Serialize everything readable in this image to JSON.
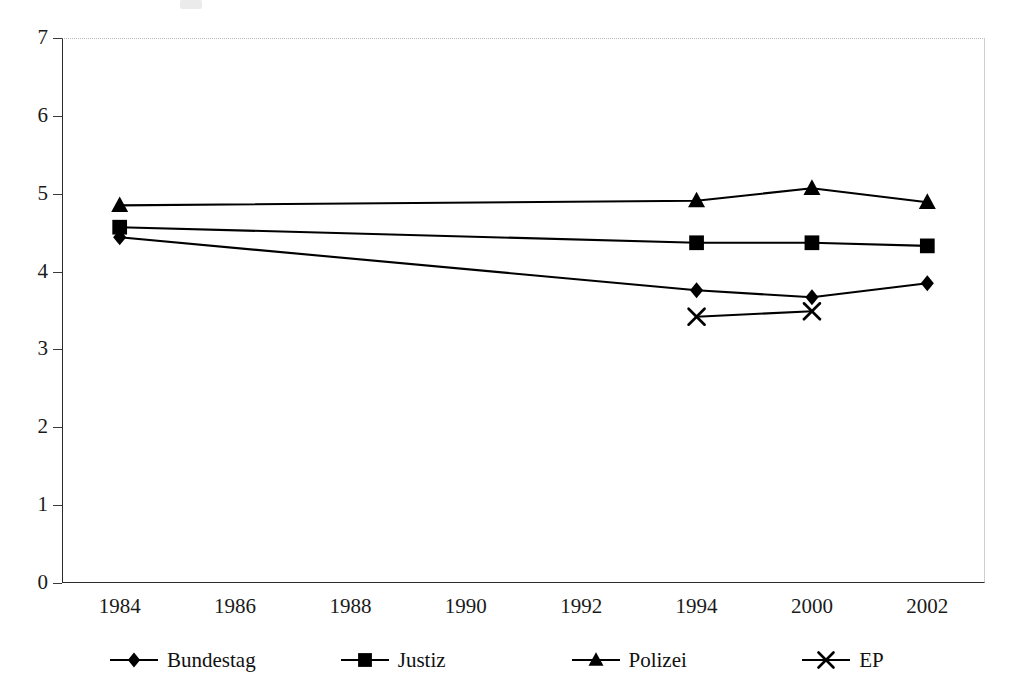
{
  "chart_data": {
    "type": "line",
    "title": "",
    "xlabel": "",
    "ylabel": "",
    "categories": [
      "1984",
      "1986",
      "1988",
      "1990",
      "1992",
      "1994",
      "2000",
      "2002"
    ],
    "ylim": [
      0,
      7
    ],
    "ytick_labels": [
      "0",
      "1",
      "2",
      "3",
      "4",
      "5",
      "6",
      "7"
    ],
    "yticks": [
      0,
      1,
      2,
      3,
      4,
      5,
      6,
      7
    ],
    "grid": false,
    "legend_position": "bottom",
    "series": [
      {
        "name": "Bundestag",
        "marker": "diamond",
        "color": "#000000",
        "values": [
          4.44,
          null,
          null,
          null,
          null,
          3.76,
          3.67,
          3.85
        ]
      },
      {
        "name": "Justiz",
        "marker": "square",
        "color": "#000000",
        "values": [
          4.57,
          null,
          null,
          null,
          null,
          4.37,
          4.37,
          4.33
        ]
      },
      {
        "name": "Polizei",
        "marker": "triangle",
        "color": "#000000",
        "values": [
          4.85,
          null,
          null,
          null,
          null,
          4.91,
          5.07,
          4.89
        ]
      },
      {
        "name": "EP",
        "marker": "x",
        "color": "#000000",
        "values": [
          null,
          null,
          null,
          null,
          null,
          3.42,
          3.49,
          null
        ]
      }
    ]
  },
  "legend": {
    "entries": [
      {
        "label": "Bundestag",
        "marker": "diamond-marker-icon"
      },
      {
        "label": "Justiz",
        "marker": "square-marker-icon"
      },
      {
        "label": "Polizei",
        "marker": "triangle-marker-icon"
      },
      {
        "label": "EP",
        "marker": "x-marker-icon"
      }
    ]
  },
  "colors": {
    "series": "#000000",
    "axis": "#2b2b2b",
    "plot_background": "#ffffff",
    "top_border": "#b9b9b9"
  }
}
